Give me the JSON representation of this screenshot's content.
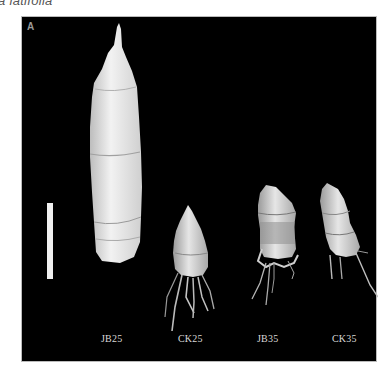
{
  "figure": {
    "caption_fragment": "a latifolia",
    "panel_label": "A",
    "scale_bar": "scale-bar",
    "specimens": [
      {
        "id": "jb25",
        "label": "JB25"
      },
      {
        "id": "ck25",
        "label": "CK25"
      },
      {
        "id": "jb35",
        "label": "JB35"
      },
      {
        "id": "ck35",
        "label": "CK35"
      }
    ],
    "colors": {
      "background": "#000000",
      "specimen": "#e8e8e8",
      "label": "#d8d8d8"
    }
  }
}
